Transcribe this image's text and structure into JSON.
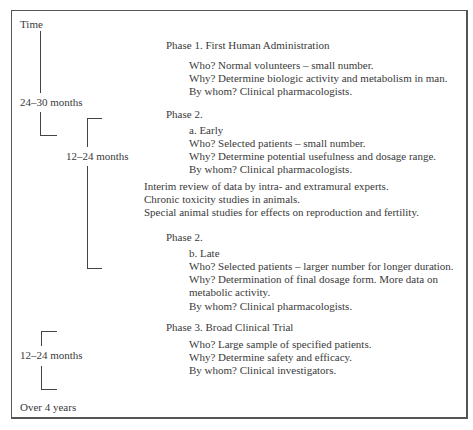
{
  "timeline": {
    "start_label": "Time",
    "end_label": "Over 4 years",
    "durations": [
      {
        "label": "24–30 months",
        "phase": "Phase 1"
      },
      {
        "label": "12–24 months",
        "phase": "Phase 2"
      },
      {
        "label": "12–24 months",
        "phase": "Phase 3"
      }
    ]
  },
  "phase1": {
    "title": "Phase 1.  First Human Administration",
    "who": "Who?  Normal volunteers – small number.",
    "why": "Why?  Determine biologic activity and metabolism in man.",
    "by_whom": "By whom?  Clinical pharmacologists."
  },
  "phase2_early": {
    "title": "Phase 2.",
    "sub": "a.  Early",
    "who": "Who?  Selected patients – small number.",
    "why": "Why?  Determine potential usefulness and dosage range.",
    "by_whom": "By whom?  Clinical pharmacologists."
  },
  "interim": {
    "line1": "Interim review of data by intra- and extramural experts.",
    "line2": "Chronic toxicity studies in animals.",
    "line3": "Special animal studies for effects on reproduction and fertility."
  },
  "phase2_late": {
    "title": "Phase 2.",
    "sub": "b.  Late",
    "who": "Who?  Selected patients – larger number for longer duration.",
    "why_1": "Why?  Determination of final dosage form.  More data on",
    "why_2": "metabolic activity.",
    "by_whom": "By whom?  Clinical pharmacologists."
  },
  "phase3": {
    "title": "Phase 3.  Broad Clinical Trial",
    "who": "Who?  Large sample of specified patients.",
    "why": "Why?  Determine safety and efficacy.",
    "by_whom": "By whom?  Clinical investigators."
  }
}
